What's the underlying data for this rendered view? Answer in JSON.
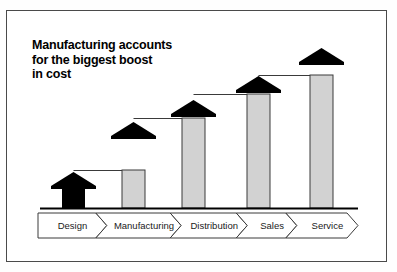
{
  "title": {
    "line1": "Manufacturing accounts",
    "line2": "for the biggest boost",
    "line3": "in cost"
  },
  "colors": {
    "bar_gray": "#d2d2d2",
    "bar_black": "#000000",
    "outline": "#3a3a3a",
    "frame": "#4a4a4a",
    "baseline": "#000000",
    "background": "#ffffff"
  },
  "process_bar": {
    "steps": [
      {
        "label": "Design"
      },
      {
        "label": "Manufacturing"
      },
      {
        "label": "Distribution"
      },
      {
        "label": "Sales"
      },
      {
        "label": "Service"
      }
    ]
  },
  "chart_data": {
    "type": "bar",
    "title": "Manufacturing accounts for the biggest boost in cost",
    "xlabel": "",
    "ylabel": "",
    "grid": false,
    "legend": null,
    "ylim": [
      0,
      160
    ],
    "baseline_y": 208,
    "note": "Stacked arrow columns: gray = base cost, black arrowhead/boost = increase over previous stage. Values in pixel-height units read off the figure.",
    "categories": [
      "Design",
      "Manufacturing",
      "Distribution",
      "Sales",
      "Service"
    ],
    "series": [
      {
        "name": "Base (gray)",
        "values": [
          0,
          38,
          90,
          114,
          133
        ]
      },
      {
        "name": "Boost (black)",
        "values": [
          36,
          48,
          18,
          18,
          27
        ]
      }
    ],
    "totals": [
      36,
      86,
      108,
      132,
      160
    ],
    "bars": [
      {
        "category": "Design",
        "x": 62,
        "width": 23,
        "gray_top": 208,
        "black_top": 172,
        "tip": 172,
        "all_black": true
      },
      {
        "category": "Manufacturing",
        "x": 122,
        "width": 23,
        "gray_top": 170,
        "black_top": 170,
        "tip": 122,
        "all_black": false
      },
      {
        "category": "Distribution",
        "x": 182,
        "width": 23,
        "gray_top": 118,
        "black_top": 118,
        "tip": 100,
        "all_black": false
      },
      {
        "category": "Sales",
        "x": 247,
        "width": 23,
        "gray_top": 94,
        "black_top": 94,
        "tip": 76,
        "all_black": false
      },
      {
        "category": "Service",
        "x": 310,
        "width": 23,
        "gray_top": 75,
        "black_top": 75,
        "tip": 48,
        "all_black": false
      }
    ],
    "connectors": [
      {
        "from": "Design",
        "to": "Manufacturing",
        "y": 170
      },
      {
        "from": "Manufacturing",
        "to": "Distribution",
        "y": 118
      },
      {
        "from": "Distribution",
        "to": "Sales",
        "y": 94
      },
      {
        "from": "Sales",
        "to": "Service",
        "y": 75
      }
    ]
  }
}
